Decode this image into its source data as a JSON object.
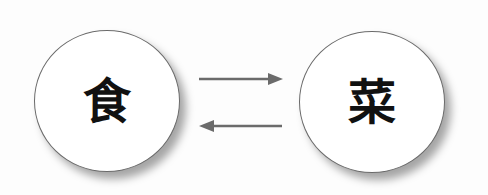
{
  "diagram": {
    "nodes": [
      {
        "id": "left",
        "label": "食"
      },
      {
        "id": "right",
        "label": "菜"
      }
    ],
    "edges": [
      {
        "from": "left",
        "to": "right",
        "direction": "right"
      },
      {
        "from": "right",
        "to": "left",
        "direction": "left"
      }
    ],
    "colors": {
      "arrow": "#6b6b6b",
      "circle_border": "#6a6a6a",
      "text": "#111111"
    }
  }
}
